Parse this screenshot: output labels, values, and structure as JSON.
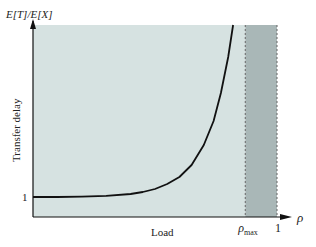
{
  "chart_data": {
    "type": "line",
    "title": "",
    "ylabel_top": "E[T]/E[X]",
    "ylabel": "Transfer delay",
    "xlabel": "Load",
    "x_axis_symbol": "ρ",
    "xlim": [
      0,
      1
    ],
    "ylim": [
      0,
      9.6
    ],
    "y_ticks": [
      {
        "value": 1,
        "label": "1"
      }
    ],
    "x_ticks": [
      {
        "value": 0.87,
        "label": "ρ",
        "sub": "max"
      },
      {
        "value": 1,
        "label": "1"
      }
    ],
    "regions": [
      {
        "name": "feasible-region",
        "from": 0,
        "to": 0.87,
        "color": "#d6e2e1"
      },
      {
        "name": "infeasible-region",
        "from": 0.87,
        "to": 1,
        "color": "#a9b7b7"
      }
    ],
    "grid": false,
    "series": [
      {
        "name": "delay-curve",
        "x": [
          0,
          0.1,
          0.2,
          0.3,
          0.4,
          0.45,
          0.5,
          0.55,
          0.6,
          0.65,
          0.7,
          0.74,
          0.77,
          0.8,
          0.82
        ],
        "y": [
          1,
          1.0,
          1.02,
          1.06,
          1.15,
          1.25,
          1.4,
          1.65,
          2.0,
          2.6,
          3.6,
          4.8,
          6.2,
          8.0,
          9.6
        ],
        "color": "#111111"
      }
    ]
  }
}
